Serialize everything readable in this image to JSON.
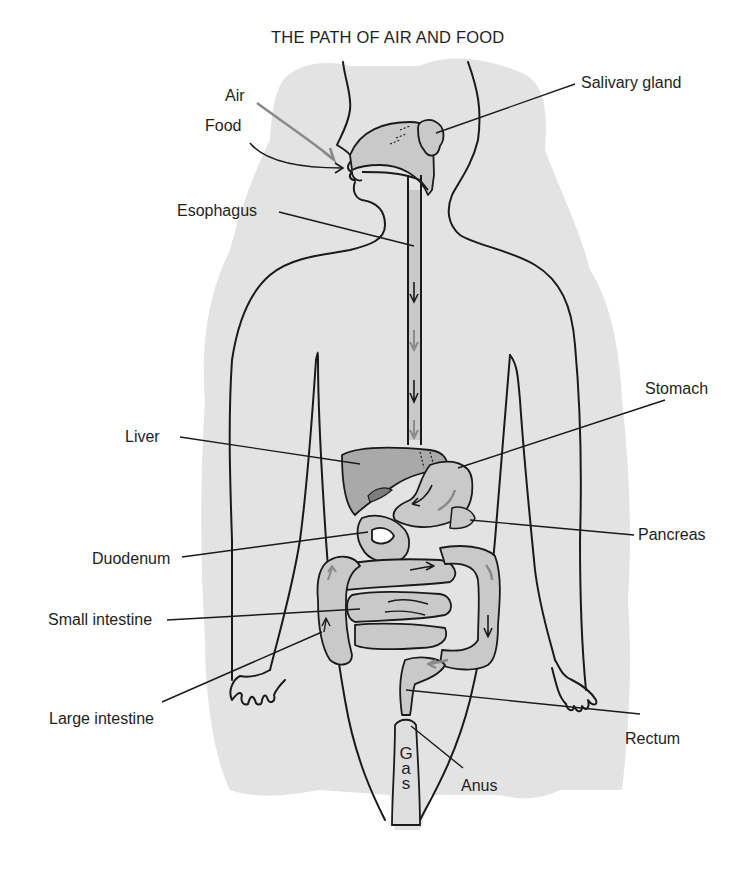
{
  "title": "THE PATH OF AIR AND FOOD",
  "labels": {
    "air": "Air",
    "food": "Food",
    "salivary_gland": "Salivary gland",
    "esophagus": "Esophagus",
    "stomach": "Stomach",
    "liver": "Liver",
    "pancreas": "Pancreas",
    "duodenum": "Duodenum",
    "small_intestine": "Small intestine",
    "large_intestine": "Large intestine",
    "rectum": "Rectum",
    "anus": "Anus",
    "gas": "Gas",
    "gas_letters": [
      "G",
      "a",
      "s"
    ]
  },
  "colors": {
    "background": "#ffffff",
    "shadow": "#e3e3e3",
    "organ_fill": "#c9c9c9",
    "liver_fill": "#a9a9a9",
    "line": "#1a1a1a",
    "gray_arrow": "#8a8a8a"
  }
}
